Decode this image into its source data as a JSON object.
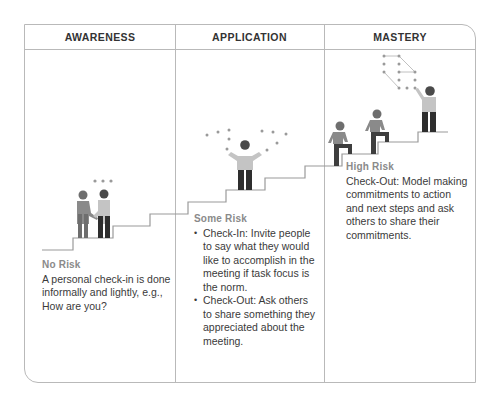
{
  "columns": [
    {
      "title": "AWARENESS",
      "risk_label": "No Risk",
      "text": "A personal check-in is done informally and lightly, e.g., How are you?"
    },
    {
      "title": "APPLICATION",
      "risk_label": "Some Risk",
      "bullets": [
        "Check-In: Invite people to say what they would like to accomplish in the meeting if task focus is the norm.",
        "Check-Out: Ask others to share something they appreciated about the meeting."
      ]
    },
    {
      "title": "MASTERY",
      "risk_label": "High Risk",
      "text": "Check-Out: Model making commitments to action and next steps and ask others to share their commitments."
    }
  ],
  "icons": {
    "awareness": "two-people-shaking-hands-icon",
    "application": "person-juggling-ideas-icon",
    "mastery": "people-climbing-stairs-icon"
  },
  "colors": {
    "border": "#b9b9b9",
    "stairs": "#9a9a9a",
    "figure_dark": "#2e2e2e",
    "figure_mid": "#6e6e6e",
    "figure_light": "#c4c4c4",
    "dots": "#9a9a9a",
    "risk_label": "#8a8a8a"
  }
}
